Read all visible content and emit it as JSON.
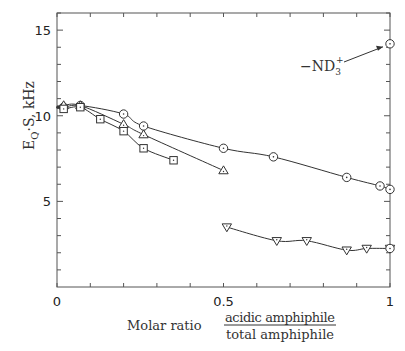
{
  "chart_data": {
    "type": "scatter",
    "title": "",
    "xlabel": "Molar ratio",
    "xlabel_fraction": {
      "numerator": "acidic amphiphile",
      "denominator": "total amphiphile"
    },
    "ylabel": "E_Q·S, kHz",
    "ylabel_parts": {
      "main": "E",
      "sub": "Q",
      "rest": "·S,  kHz"
    },
    "xlim": [
      0,
      1
    ],
    "ylim": [
      0,
      16
    ],
    "x_ticks": [
      {
        "value": 0,
        "label": "0"
      },
      {
        "value": 0.5,
        "label": "0.5"
      },
      {
        "value": 1,
        "label": "1"
      }
    ],
    "y_ticks": [
      {
        "value": 5,
        "label": "5"
      },
      {
        "value": 10,
        "label": "10"
      },
      {
        "value": 15,
        "label": "15"
      }
    ],
    "x_minor_step": 0.1,
    "y_minor_step": 1,
    "grid": false,
    "legend": null,
    "annotation": {
      "text": "−ND",
      "sub": "3",
      "sup": "+",
      "points_to": {
        "x": 1.0,
        "y": 14.2
      }
    },
    "series": [
      {
        "name": "circle",
        "marker": "circle",
        "x": [
          0.02,
          0.07,
          0.2,
          0.26,
          0.5,
          0.65,
          0.87,
          0.97,
          1.0
        ],
        "y": [
          10.5,
          10.6,
          10.1,
          9.4,
          8.1,
          7.6,
          6.4,
          5.9,
          5.7
        ]
      },
      {
        "name": "triangle",
        "marker": "triangle-up",
        "x": [
          0.02,
          0.07,
          0.2,
          0.26,
          0.5
        ],
        "y": [
          10.6,
          10.6,
          9.5,
          8.9,
          6.8
        ]
      },
      {
        "name": "square",
        "marker": "square",
        "x": [
          0.02,
          0.07,
          0.13,
          0.2,
          0.26,
          0.35
        ],
        "y": [
          10.4,
          10.5,
          9.8,
          9.1,
          8.1,
          7.4
        ]
      },
      {
        "name": "inverted-triangle",
        "marker": "triangle-down",
        "x": [
          0.51,
          0.66,
          0.75,
          0.87,
          0.93,
          1.0
        ],
        "y": [
          3.5,
          2.7,
          2.7,
          2.15,
          2.25,
          2.25
        ]
      },
      {
        "name": "ND3+ point",
        "marker": "circle",
        "x": [
          1.0
        ],
        "y": [
          14.2
        ]
      },
      {
        "name": "circle-at-1",
        "marker": "circle",
        "x": [
          1.0
        ],
        "y": [
          2.25
        ]
      }
    ],
    "reference_point": {
      "x": 0,
      "y": 10.5,
      "marker": "filled-dot"
    }
  }
}
